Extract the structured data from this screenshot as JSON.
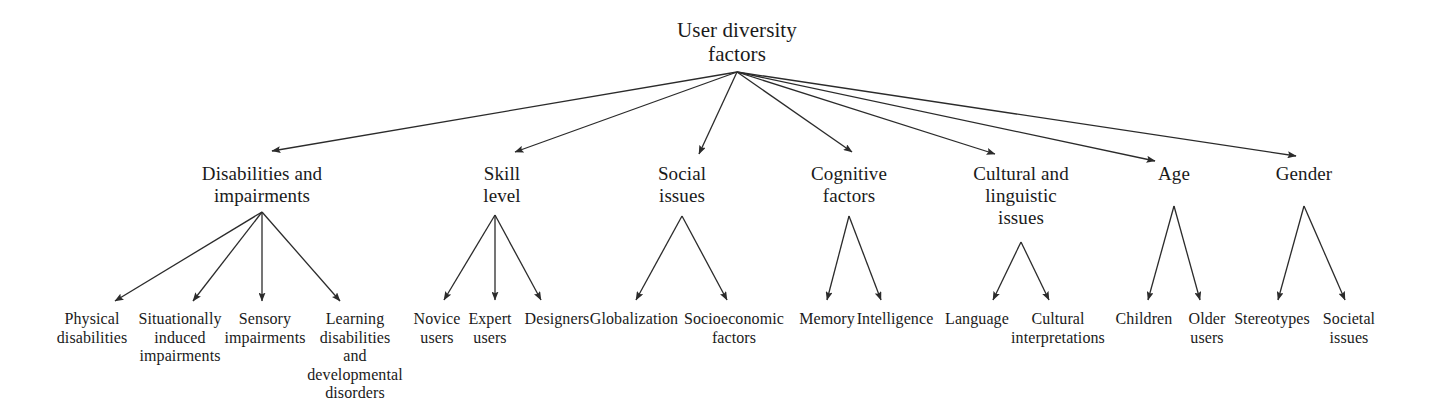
{
  "diagram": {
    "title": "User diversity factors",
    "type": "hierarchy-tree",
    "orientation": "top-down",
    "canvas": {
      "width": 1434,
      "height": 400
    },
    "colors": {
      "background": "#ffffff",
      "text": "#1a1a1a",
      "edge": "#2b2b2b"
    },
    "root": {
      "id": "root",
      "label": "User diversity\nfactors",
      "x": 737,
      "y": 18,
      "width": 240,
      "anchor": {
        "x": 737,
        "y": 72
      }
    },
    "branches": [
      {
        "id": "disabilities-and-impairments",
        "label": "Disabilities and\nimpairments",
        "x": 262,
        "y": 163,
        "width": 230,
        "arrow_tip": {
          "x": 272,
          "y": 151
        },
        "anchor": {
          "x": 262,
          "y": 212
        },
        "children": [
          {
            "id": "physical-disabilities",
            "label": "Physical\ndisabilities",
            "x": 92,
            "y": 310,
            "width": 104,
            "arrow_tip": {
              "x": 115,
              "y": 301
            }
          },
          {
            "id": "situationally-induced-impairments",
            "label": "Situationally\ninduced\nimpairments",
            "x": 180,
            "y": 310,
            "width": 118,
            "arrow_tip": {
              "x": 193,
              "y": 301
            }
          },
          {
            "id": "sensory-impairments",
            "label": "Sensory\nimpairments",
            "x": 265,
            "y": 310,
            "width": 112,
            "arrow_tip": {
              "x": 262,
              "y": 301
            }
          },
          {
            "id": "learning-disabilities-and-developmental-disorders",
            "label": "Learning\ndisabilities\nand\ndevelopmental\ndisorders",
            "x": 355,
            "y": 310,
            "width": 120,
            "arrow_tip": {
              "x": 340,
              "y": 301
            }
          }
        ]
      },
      {
        "id": "skill-level",
        "label": "Skill\nlevel",
        "x": 502,
        "y": 163,
        "width": 120,
        "arrow_tip": {
          "x": 515,
          "y": 152
        },
        "anchor": {
          "x": 495,
          "y": 215
        },
        "children": [
          {
            "id": "novice-users",
            "label": "Novice\nusers",
            "x": 437,
            "y": 310,
            "width": 74,
            "arrow_tip": {
              "x": 444,
              "y": 300
            }
          },
          {
            "id": "expert-users",
            "label": "Expert\nusers",
            "x": 490,
            "y": 310,
            "width": 70,
            "arrow_tip": {
              "x": 495,
              "y": 300
            }
          },
          {
            "id": "designers",
            "label": "Designers",
            "x": 557,
            "y": 310,
            "width": 98,
            "arrow_tip": {
              "x": 541,
              "y": 300
            }
          }
        ]
      },
      {
        "id": "social-issues",
        "label": "Social\nissues",
        "x": 682,
        "y": 163,
        "width": 120,
        "arrow_tip": {
          "x": 699,
          "y": 154
        },
        "anchor": {
          "x": 682,
          "y": 216
        },
        "children": [
          {
            "id": "globalization",
            "label": "Globalization",
            "x": 634,
            "y": 310,
            "width": 128,
            "arrow_tip": {
              "x": 636,
              "y": 300
            }
          },
          {
            "id": "socioeconomic-factors",
            "label": "Socioeconomic\nfactors",
            "x": 734,
            "y": 310,
            "width": 140,
            "arrow_tip": {
              "x": 727,
              "y": 300
            }
          }
        ]
      },
      {
        "id": "cognitive-factors",
        "label": "Cognitive\nfactors",
        "x": 849,
        "y": 163,
        "width": 150,
        "arrow_tip": {
          "x": 852,
          "y": 152
        },
        "anchor": {
          "x": 849,
          "y": 216
        },
        "children": [
          {
            "id": "memory",
            "label": "Memory",
            "x": 827,
            "y": 310,
            "width": 84,
            "arrow_tip": {
              "x": 827,
              "y": 300
            }
          },
          {
            "id": "intelligence",
            "label": "Intelligence",
            "x": 895,
            "y": 310,
            "width": 108,
            "arrow_tip": {
              "x": 881,
              "y": 300
            }
          }
        ]
      },
      {
        "id": "cultural-and-linguistic-issues",
        "label": "Cultural and\nlinguistic\nissues",
        "x": 1021,
        "y": 163,
        "width": 160,
        "arrow_tip": {
          "x": 995,
          "y": 154
        },
        "anchor": {
          "x": 1021,
          "y": 242
        },
        "children": [
          {
            "id": "language",
            "label": "Language",
            "x": 977,
            "y": 310,
            "width": 96,
            "arrow_tip": {
              "x": 993,
              "y": 300
            }
          },
          {
            "id": "cultural-interpretations",
            "label": "Cultural\ninterpretations",
            "x": 1058,
            "y": 310,
            "width": 130,
            "arrow_tip": {
              "x": 1049,
              "y": 300
            }
          }
        ]
      },
      {
        "id": "age",
        "label": "Age",
        "x": 1174,
        "y": 163,
        "width": 90,
        "arrow_tip": {
          "x": 1155,
          "y": 161
        },
        "anchor": {
          "x": 1174,
          "y": 206
        },
        "children": [
          {
            "id": "children",
            "label": "Children",
            "x": 1144,
            "y": 310,
            "width": 88,
            "arrow_tip": {
              "x": 1148,
              "y": 300
            }
          },
          {
            "id": "older-users",
            "label": "Older\nusers",
            "x": 1207,
            "y": 310,
            "width": 70,
            "arrow_tip": {
              "x": 1200,
              "y": 300
            }
          }
        ]
      },
      {
        "id": "gender",
        "label": "Gender",
        "x": 1304,
        "y": 163,
        "width": 110,
        "arrow_tip": {
          "x": 1296,
          "y": 156
        },
        "anchor": {
          "x": 1304,
          "y": 206
        },
        "children": [
          {
            "id": "stereotypes",
            "label": "Stereotypes",
            "x": 1272,
            "y": 310,
            "width": 110,
            "arrow_tip": {
              "x": 1278,
              "y": 300
            }
          },
          {
            "id": "societal-issues",
            "label": "Societal\nissues",
            "x": 1349,
            "y": 310,
            "width": 86,
            "arrow_tip": {
              "x": 1345,
              "y": 300
            }
          }
        ]
      }
    ]
  }
}
